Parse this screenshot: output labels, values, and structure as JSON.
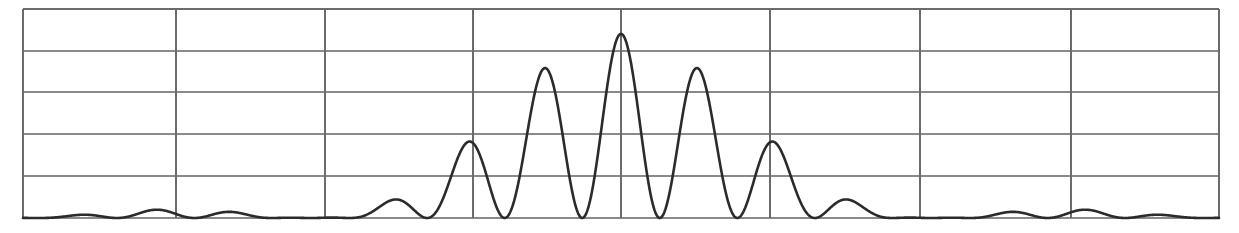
{
  "figure": {
    "name": "double-slit-interference-intensity-pattern",
    "background_color": "#ffffff",
    "width": 1239,
    "height": 233
  },
  "chart_data": {
    "type": "line",
    "title": "",
    "subtitle": "",
    "xlabel": "",
    "ylabel": "",
    "annotations": [],
    "legend": {
      "entries": [],
      "position": "none"
    },
    "grid": {
      "enabled": true,
      "horizontal_count": 6,
      "vertical_count": 9,
      "horizontal_pixel_y": [
        9,
        51,
        92,
        134,
        176,
        218
      ],
      "vertical_pixel_x": [
        23,
        176,
        325,
        473,
        621,
        770,
        920,
        1071,
        1219
      ],
      "major_color": "#6b6b6b",
      "minor_color": "#8a8a8a"
    },
    "axes": {
      "plot_left": 23,
      "plot_right": 1219,
      "plot_top": 9,
      "plot_bottom": 218,
      "xlim": [
        -7.71,
        7.71
      ],
      "ylim": [
        0,
        1.135
      ],
      "x_tick_labels": [],
      "y_tick_labels": []
    },
    "series": [
      {
        "name": "intensity",
        "color": "#2b2b2b",
        "line_width": 2.6,
        "model": "double-slit",
        "description": "Two-slit interference fringes modulated by a single-slit diffraction envelope",
        "formula": "I(x) = cos^2(pi*x/d) * (sin(pi*x/a)/(pi*x/a))^2",
        "params": {
          "fringe_spacing_px": 77.5,
          "fringe_spacing_units": 1.0,
          "envelope_half_width_units": 4.0,
          "center_units": 0.0,
          "peak_value": 1.0,
          "sample_count": 2400
        },
        "peaks": [
          {
            "x_px": 621,
            "y_px": 50,
            "value": 1.0
          },
          {
            "x_px": 543,
            "y_px": 65,
            "value": 0.94
          },
          {
            "x_px": 698,
            "y_px": 65,
            "value": 0.94
          },
          {
            "x_px": 466,
            "y_px": 104,
            "value": 0.77
          },
          {
            "x_px": 776,
            "y_px": 104,
            "value": 0.77
          },
          {
            "x_px": 388,
            "y_px": 152,
            "value": 0.55
          },
          {
            "x_px": 853,
            "y_px": 152,
            "value": 0.55
          },
          {
            "x_px": 311,
            "y_px": 190,
            "value": 0.3
          },
          {
            "x_px": 930,
            "y_px": 190,
            "value": 0.3
          },
          {
            "x_px": 234,
            "y_px": 211,
            "value": 0.08
          },
          {
            "x_px": 1008,
            "y_px": 211,
            "value": 0.08
          },
          {
            "x_px": 156,
            "y_px": 213,
            "value": 0.05
          },
          {
            "x_px": 1085,
            "y_px": 213,
            "value": 0.05
          },
          {
            "x_px": 79,
            "y_px": 214,
            "value": 0.04
          },
          {
            "x_px": 1163,
            "y_px": 214,
            "value": 0.04
          }
        ],
        "x": [
          -7.71,
          -7.0,
          -6.5,
          -6.0,
          -5.5,
          -5.0,
          -4.5,
          -4.0,
          -3.5,
          -3.0,
          -2.5,
          -2.0,
          -1.5,
          -1.0,
          -0.5,
          0.0,
          0.5,
          1.0,
          1.5,
          2.0,
          2.5,
          3.0,
          3.5,
          4.0,
          4.5,
          5.0,
          5.5,
          6.0,
          6.5,
          7.0,
          7.71
        ],
        "values": [
          0.018,
          0.021,
          0.0,
          0.028,
          0.0,
          0.04,
          0.0,
          0.0,
          0.0,
          0.109,
          0.0,
          0.23,
          0.0,
          0.405,
          0.0,
          1.0,
          0.0,
          0.405,
          0.0,
          0.23,
          0.0,
          0.109,
          0.0,
          0.0,
          0.0,
          0.04,
          0.0,
          0.028,
          0.0,
          0.021,
          0.018
        ]
      }
    ]
  }
}
